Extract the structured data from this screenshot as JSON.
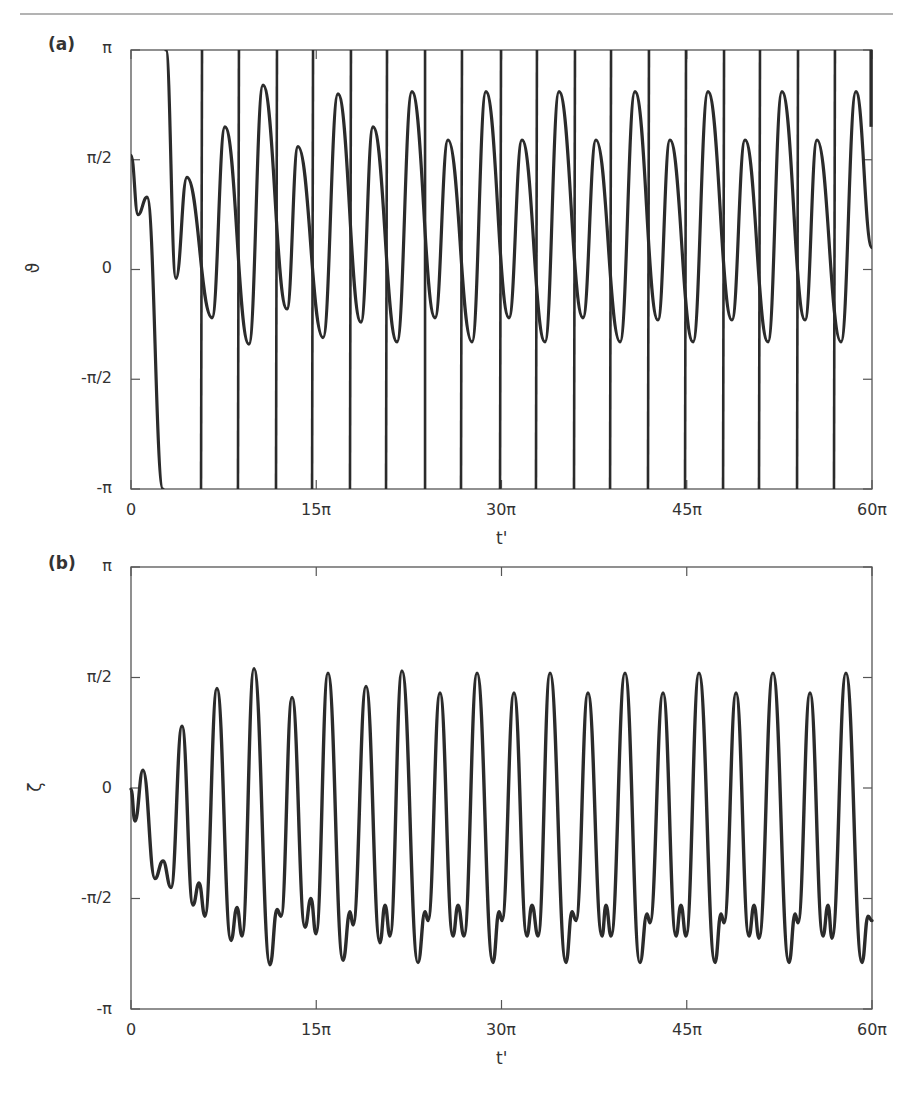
{
  "page": {
    "header_rule": true
  },
  "panels": [
    {
      "id": "a",
      "label": "(a)",
      "ylabel": "ϑ",
      "xlabel": "t'",
      "yticks": [
        "π",
        "π/2",
        "0",
        "-π/2",
        "-π"
      ],
      "xticks": [
        "0",
        "15π",
        "30π",
        "45π",
        "60π"
      ]
    },
    {
      "id": "b",
      "label": "(b)",
      "ylabel": "ζ",
      "xlabel": "t'",
      "yticks": [
        "π",
        "π/2",
        "0",
        "-π/2",
        "-π"
      ],
      "xticks": [
        "0",
        "15π",
        "30π",
        "45π",
        "60π"
      ]
    }
  ],
  "colors": {
    "line": "#2b2b2b",
    "axis": "#555555",
    "text": "#333333",
    "rule": "#b3b3b3"
  },
  "chart_data": [
    {
      "type": "line",
      "title": "(a)",
      "xlabel": "t'",
      "ylabel": "ϑ",
      "x_unit": "π",
      "y_unit": "π",
      "xlim": [
        0,
        60
      ],
      "ylim": [
        -1,
        1
      ],
      "xtick_values": [
        0,
        15,
        30,
        45,
        60
      ],
      "xtick_labels": [
        "0",
        "15π",
        "30π",
        "45π",
        "60π"
      ],
      "ytick_values": [
        1,
        0.5,
        0,
        -0.5,
        -1
      ],
      "ytick_labels": [
        "π",
        "π/2",
        "0",
        "-π/2",
        "-π"
      ],
      "grid": false,
      "wrapped": true,
      "initial_segment": {
        "x": [
          0,
          0.57,
          1.3,
          2.59
        ],
        "y": [
          0.52,
          0.25,
          0.33,
          -1.0
        ]
      },
      "oscillation": {
        "x": [
          2.83,
          3.64,
          4.53,
          6.56,
          7.61,
          9.55,
          10.69,
          12.63,
          13.52,
          15.55,
          16.76,
          18.62,
          19.6,
          21.54,
          22.75,
          24.62,
          25.67,
          27.61,
          28.74,
          30.61,
          31.66,
          33.52,
          34.66,
          36.6,
          37.65,
          39.6,
          40.81,
          42.67,
          43.64,
          45.51,
          46.72,
          48.66,
          49.72,
          51.58,
          52.71,
          54.58,
          55.55,
          57.49,
          58.7,
          60.0
        ],
        "y": [
          1.0,
          -0.04,
          0.42,
          -0.22,
          0.65,
          -0.34,
          0.84,
          -0.18,
          0.56,
          -0.31,
          0.8,
          -0.24,
          0.65,
          -0.33,
          0.81,
          -0.22,
          0.59,
          -0.33,
          0.81,
          -0.22,
          0.59,
          -0.33,
          0.81,
          -0.22,
          0.59,
          -0.33,
          0.81,
          -0.23,
          0.59,
          -0.33,
          0.81,
          -0.23,
          0.59,
          -0.33,
          0.81,
          -0.23,
          0.59,
          -0.33,
          0.81,
          0.1
        ]
      },
      "phase_slips": {
        "x_top": [
          5.75,
          8.74,
          11.82,
          14.74,
          17.81,
          20.73,
          23.81,
          26.8,
          29.96,
          32.87,
          35.95,
          38.87,
          41.94,
          44.94,
          48.02,
          50.93,
          54.01,
          57.0
        ],
        "x_bottom": [
          5.67,
          8.66,
          11.74,
          14.66,
          17.73,
          20.65,
          23.81,
          26.72,
          29.88,
          32.79,
          35.87,
          38.79,
          41.86,
          44.86,
          47.94,
          50.85,
          53.93,
          56.92
        ]
      },
      "final_partial_slip": {
        "x": 59.92,
        "y_from": 1.0,
        "y_to": 0.65
      }
    },
    {
      "type": "line",
      "title": "(b)",
      "xlabel": "t'",
      "ylabel": "ζ",
      "x_unit": "π",
      "y_unit": "π",
      "xlim": [
        0,
        60
      ],
      "ylim": [
        -1,
        1
      ],
      "xtick_values": [
        0,
        15,
        30,
        45,
        60
      ],
      "xtick_labels": [
        "0",
        "15π",
        "30π",
        "45π",
        "60π"
      ],
      "ytick_values": [
        1,
        0.5,
        0,
        -0.5,
        -1
      ],
      "ytick_labels": [
        "π",
        "π/2",
        "0",
        "-π/2",
        "-π"
      ],
      "grid": false,
      "series": [
        {
          "name": "ζ",
          "x": [
            0,
            0.32,
            0.97,
            1.94,
            2.59,
            3.24,
            4.13,
            5.02,
            5.51,
            5.99,
            6.96,
            8.1,
            8.58,
            8.99,
            9.96,
            11.26,
            11.82,
            12.15,
            13.04,
            14.09,
            14.57,
            14.98,
            15.95,
            17.17,
            17.73,
            17.98,
            19.03,
            20.16,
            20.57,
            20.97,
            21.94,
            23.24,
            23.81,
            24.05,
            25.02,
            26.07,
            26.48,
            26.96,
            28.02,
            29.31,
            29.8,
            30.04,
            31.01,
            32.06,
            32.47,
            32.96,
            33.93,
            35.22,
            35.71,
            36.03,
            37.0,
            38.14,
            38.46,
            38.87,
            40.0,
            41.21,
            41.78,
            42.02,
            43.08,
            44.13,
            44.53,
            44.94,
            45.99,
            47.29,
            47.77,
            48.02,
            48.99,
            50.04,
            50.45,
            50.85,
            51.98,
            53.28,
            53.77,
            54.01,
            54.98,
            56.03,
            56.44,
            56.76,
            57.89,
            59.19,
            59.68,
            60.0
          ],
          "y": [
            -0.005,
            -0.15,
            0.08,
            -0.41,
            -0.33,
            -0.45,
            0.28,
            -0.53,
            -0.43,
            -0.58,
            0.45,
            -0.69,
            -0.54,
            -0.67,
            0.54,
            -0.8,
            -0.55,
            -0.58,
            0.41,
            -0.63,
            -0.5,
            -0.66,
            0.52,
            -0.78,
            -0.56,
            -0.62,
            0.46,
            -0.7,
            -0.53,
            -0.67,
            0.53,
            -0.79,
            -0.56,
            -0.6,
            0.43,
            -0.67,
            -0.53,
            -0.67,
            0.52,
            -0.79,
            -0.56,
            -0.6,
            0.43,
            -0.67,
            -0.53,
            -0.67,
            0.52,
            -0.79,
            -0.56,
            -0.6,
            0.43,
            -0.67,
            -0.53,
            -0.67,
            0.52,
            -0.79,
            -0.57,
            -0.61,
            0.43,
            -0.67,
            -0.53,
            -0.67,
            0.52,
            -0.79,
            -0.57,
            -0.61,
            0.43,
            -0.67,
            -0.53,
            -0.68,
            0.52,
            -0.79,
            -0.57,
            -0.61,
            0.43,
            -0.67,
            -0.53,
            -0.68,
            0.52,
            -0.79,
            -0.58,
            -0.6
          ]
        }
      ]
    }
  ]
}
